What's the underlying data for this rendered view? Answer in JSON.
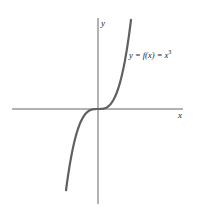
{
  "chart_data": {
    "type": "line",
    "title": "",
    "xlabel": "x",
    "ylabel": "y",
    "grid": false,
    "series": [
      {
        "name": "y = f(x) = x^3",
        "function": "x^3"
      }
    ],
    "annotations": [
      {
        "text": "y = f(x) = x",
        "superscript": "3"
      }
    ],
    "colors": {
      "curve": "#606060",
      "axes": "#555555"
    }
  }
}
